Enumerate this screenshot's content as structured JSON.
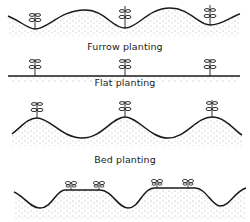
{
  "diagram": {
    "type": "planting-methods-illustration",
    "panels": [
      {
        "id": "furrow",
        "caption": "Furrow planting",
        "plants": 3,
        "plant_position": "in furrows between ridges"
      },
      {
        "id": "flat",
        "caption": "Flat planting",
        "plants": 3,
        "plant_position": "on flat ground"
      },
      {
        "id": "ridge",
        "caption": "",
        "plants": 3,
        "plant_position": "on top of ridges"
      },
      {
        "id": "bed",
        "caption": "Bed planting",
        "plants": 4,
        "plant_position": "two per raised bed"
      }
    ],
    "colors": {
      "ink": "#1a1a1a",
      "background": "#ffffff",
      "soil_stipple": "#555555"
    }
  }
}
